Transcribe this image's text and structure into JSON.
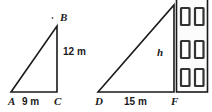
{
  "figure": {
    "background_color": "#ffffff",
    "line_color": "#1a1a1a",
    "window_fill": "#ffffff",
    "window_border_color": "#333333",
    "building_fill": "#fcfcfc"
  },
  "triangle_left": {
    "name": "triangle-ABC",
    "vertices": {
      "A": {
        "label": "A",
        "x": 11,
        "y": 92
      },
      "B": {
        "label": "B",
        "x": 57,
        "y": 26
      },
      "C": {
        "label": "C",
        "x": 57,
        "y": 92
      }
    },
    "dimensions": {
      "base": {
        "label": "9 m",
        "value": 9,
        "unit": "m"
      },
      "height": {
        "label": "12 m",
        "value": 12,
        "unit": "m"
      }
    },
    "tick_mark": {
      "name": "vertex-tick",
      "x": 52,
      "y": 17
    }
  },
  "triangle_right": {
    "name": "triangle-DEF",
    "vertices": {
      "D": {
        "label": "D",
        "x": 98,
        "y": 92
      },
      "E": {
        "label": "",
        "x": 174,
        "y": 5
      },
      "F": {
        "label": "F",
        "x": 174,
        "y": 92
      }
    },
    "dimensions": {
      "base": {
        "label": "15 m",
        "value": 15,
        "unit": "m"
      },
      "height": {
        "label": "h",
        "value": null,
        "unit": "m"
      }
    }
  },
  "building": {
    "name": "building",
    "x": 176,
    "y": 0,
    "width": 32,
    "height": 92,
    "window_rows": 3,
    "window_cols": 2,
    "windows": [
      {
        "row": 1,
        "col": 1
      },
      {
        "row": 1,
        "col": 2
      },
      {
        "row": 2,
        "col": 1
      },
      {
        "row": 2,
        "col": 2
      },
      {
        "row": 3,
        "col": 1
      },
      {
        "row": 3,
        "col": 2
      }
    ]
  }
}
